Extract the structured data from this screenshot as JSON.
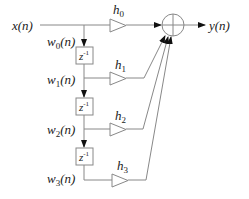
{
  "diagram": {
    "input_label": "x(n)",
    "output_label": "y(n)",
    "taps": [
      {
        "state": "w",
        "sub": "0",
        "coef": "h",
        "coef_sub": "0"
      },
      {
        "state": "w",
        "sub": "1",
        "coef": "h",
        "coef_sub": "1"
      },
      {
        "state": "w",
        "sub": "2",
        "coef": "h",
        "coef_sub": "2"
      },
      {
        "state": "w",
        "sub": "3",
        "coef": "h",
        "coef_sub": "3"
      }
    ],
    "delay_label": "z",
    "delay_exp": "-1",
    "arg": "(n)",
    "summer_symbol": "+"
  }
}
